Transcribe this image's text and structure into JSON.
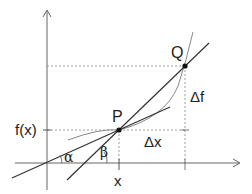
{
  "diagram": {
    "colors": {
      "axis": "#555555",
      "secant": "#333333",
      "tangent": "#333333",
      "curve": "#888888",
      "guides": "#888888",
      "point": "#111111"
    },
    "points": {
      "P": {
        "label": "P",
        "x": 119,
        "y": 130
      },
      "Q": {
        "label": "Q",
        "x": 185,
        "y": 66
      }
    },
    "labels": {
      "fx": "f(x)",
      "x": "x",
      "delta_x": "Δx",
      "delta_f": "Δf",
      "alpha": "α",
      "beta": "β",
      "P": "P",
      "Q": "Q"
    }
  }
}
